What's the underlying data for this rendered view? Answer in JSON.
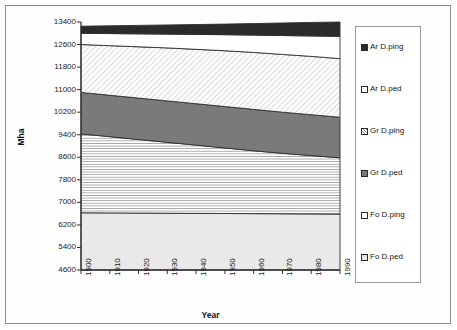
{
  "chart_data": {
    "type": "area",
    "stacked": true,
    "title": "",
    "xlabel": "Year",
    "ylabel": "Mha",
    "x": [
      1900,
      1910,
      1920,
      1930,
      1940,
      1950,
      1960,
      1970,
      1980,
      1990
    ],
    "xtick_labels": [
      "1900",
      "1910",
      "1920",
      "1930",
      "1940",
      "1950",
      "1960",
      "1970",
      "1980",
      "1990"
    ],
    "ytick_labels": [
      "4600",
      "5400",
      "6200",
      "7000",
      "7800",
      "8600",
      "9400",
      "10200",
      "11000",
      "11800",
      "12600",
      "13400"
    ],
    "yticks": [
      4600,
      5400,
      6200,
      7000,
      7800,
      8600,
      9400,
      10200,
      11000,
      11800,
      12600,
      13400
    ],
    "ylim": [
      4600,
      13400
    ],
    "xlim": [
      1900,
      1990
    ],
    "grid": false,
    "legend_position": "right",
    "stack_order_bottom_to_top": [
      "Fo D.ped",
      "Fo D.ping",
      "Gr D.ped",
      "Gr D.ping",
      "Ar D.ped",
      "Ar D.ping"
    ],
    "series": [
      {
        "name": "Fo D.ped",
        "cumulative_top": [
          6630,
          6625,
          6620,
          6615,
          6610,
          6605,
          6600,
          6595,
          6590,
          6585
        ],
        "fill": "#e9e9e9",
        "pattern": "solid"
      },
      {
        "name": "Fo D.ping",
        "cumulative_top": [
          9430,
          9330,
          9230,
          9130,
          9030,
          8930,
          8830,
          8740,
          8660,
          8580
        ],
        "fill": "#ffffff",
        "pattern": "horizontal-lines"
      },
      {
        "name": "Gr D.ped",
        "cumulative_top": [
          10900,
          10800,
          10700,
          10600,
          10500,
          10400,
          10300,
          10200,
          10110,
          10020
        ],
        "fill": "#7a7a7a",
        "pattern": "solid"
      },
      {
        "name": "Gr D.ping",
        "cumulative_top": [
          12600,
          12560,
          12520,
          12480,
          12430,
          12380,
          12320,
          12250,
          12180,
          12100
        ],
        "fill": "#ffffff",
        "pattern": "diagonal-lines"
      },
      {
        "name": "Ar D.ped",
        "cumulative_top": [
          13000,
          12990,
          12980,
          12970,
          12960,
          12950,
          12935,
          12920,
          12905,
          12890
        ],
        "fill": "#ffffff",
        "pattern": "solid"
      },
      {
        "name": "Ar D.ping",
        "cumulative_top": [
          13250,
          13265,
          13280,
          13295,
          13310,
          13325,
          13345,
          13365,
          13385,
          13400
        ],
        "fill": "#2b2b2b",
        "pattern": "solid"
      }
    ]
  },
  "legend": {
    "items": [
      {
        "label": "Ar D.ping",
        "swatch": "sw-ar-ping"
      },
      {
        "label": "Ar D.ped",
        "swatch": "sw-ar-ped"
      },
      {
        "label": "Gr D.ping",
        "swatch": "sw-gr-ping"
      },
      {
        "label": "Gr D.ped",
        "swatch": "sw-gr-ped"
      },
      {
        "label": "Fo D.ping",
        "swatch": "sw-fo-ping"
      },
      {
        "label": "Fo D.ped",
        "swatch": "sw-fo-ped"
      }
    ]
  },
  "colors": {
    "axis": "#333333",
    "text": "#151515",
    "frame": "#8c8c8c",
    "dark_band": "#2b2b2b",
    "gray_band": "#7a7a7a",
    "light_band": "#e9e9e9"
  }
}
